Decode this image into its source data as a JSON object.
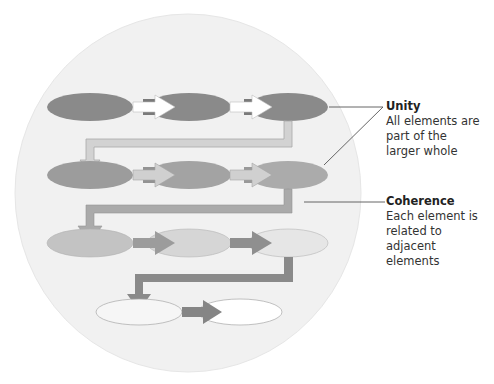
{
  "diagram": {
    "background_circle_color": "#f1f1f1",
    "rows": [
      {
        "row": 1,
        "fill": "#8a8a8a",
        "arrow_color": "#ffffff",
        "elements": [
          {
            "cx": 90,
            "cy": 107
          },
          {
            "cx": 189,
            "cy": 107
          },
          {
            "cx": 288,
            "cy": 107
          }
        ]
      },
      {
        "row": 2,
        "fill": "#9c9c9c",
        "arrow_color": "#cfcfcf",
        "elements": [
          {
            "cx": 90,
            "cy": 175
          },
          {
            "cx": 189,
            "cy": 175
          },
          {
            "cx": 288,
            "cy": 175
          }
        ]
      },
      {
        "row": 3,
        "fill": "#c4c4c4",
        "arrow_color": "#9a9a9a",
        "elements": [
          {
            "cx": 90,
            "cy": 243
          },
          {
            "cx": 189,
            "cy": 243
          },
          {
            "cx": 288,
            "cy": 243
          }
        ]
      },
      {
        "row": 4,
        "fill": "#f5f5f5",
        "arrow_color": "#8a8a8a",
        "elements": [
          {
            "cx": 139,
            "cy": 312
          },
          {
            "cx": 240,
            "cy": 312
          }
        ]
      }
    ],
    "connector_colors": [
      "#d2d2d2",
      "#a9a9a9",
      "#8f8f8f"
    ]
  },
  "annotations": {
    "unity": {
      "title": "Unity",
      "lines": [
        "All elements are",
        "part of the",
        "larger whole"
      ]
    },
    "coherence": {
      "title": "Coherence",
      "lines": [
        "Each element is",
        "related to adjacent",
        "elements"
      ]
    }
  }
}
